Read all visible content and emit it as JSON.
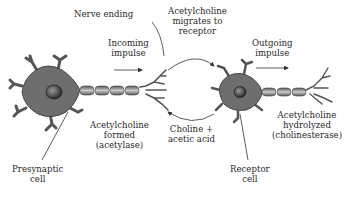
{
  "labels": {
    "nerve_ending": "Nerve ending",
    "incoming_impulse": [
      "Incoming",
      "impulse"
    ],
    "ach_migrates": [
      "Acetylcholine",
      "migrates to",
      "receptor"
    ],
    "outgoing_impulse": [
      "Outgoing",
      "impulse"
    ],
    "ach_formed": [
      "Acetylcholine",
      "formed",
      "(acetylase)"
    ],
    "choline_acetic": [
      "Choline +",
      "acetic acid"
    ],
    "ach_hydrolyzed": [
      "Acetylcholine",
      "hydrolyzed",
      "(cholinesterase)"
    ],
    "presynaptic_cell": [
      "Presynaptic",
      "cell"
    ],
    "receptor_cell": [
      "Receptor",
      "cell"
    ]
  },
  "colors": {
    "cell_body": "#6e6e6e",
    "nucleus": "#3a3a3a",
    "axon": "#8a8a8a",
    "line": "#333333"
  }
}
